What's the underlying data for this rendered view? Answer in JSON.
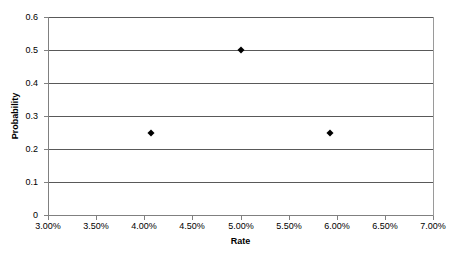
{
  "chart_data": {
    "type": "scatter",
    "title": "",
    "subtitle": "",
    "xlabel": "Rate",
    "ylabel": "Probability",
    "xlim": [
      3.0,
      7.0
    ],
    "ylim": [
      0,
      0.6
    ],
    "grid": "horizontal",
    "legend": "none",
    "x_tick_labels": [
      "3.00%",
      "3.50%",
      "4.00%",
      "4.50%",
      "5.00%",
      "5.50%",
      "6.00%",
      "6.50%",
      "7.00%"
    ],
    "x_tick_values": [
      3.0,
      3.5,
      4.0,
      4.5,
      5.0,
      5.5,
      6.0,
      6.5,
      7.0
    ],
    "y_tick_labels": [
      "0",
      "0.1",
      "0.2",
      "0.3",
      "0.4",
      "0.5",
      "0.6"
    ],
    "y_tick_values": [
      0,
      0.1,
      0.2,
      0.3,
      0.4,
      0.5,
      0.6
    ],
    "marker_shape": "diamond",
    "marker_color": "#000000",
    "points": [
      {
        "x": 4.07,
        "y": 0.25,
        "x_label": "4.07%",
        "y_label": "0.25"
      },
      {
        "x": 5.0,
        "y": 0.5,
        "x_label": "5.00%",
        "y_label": "0.5"
      },
      {
        "x": 5.93,
        "y": 0.25,
        "x_label": "5.93%",
        "y_label": "0.25"
      }
    ]
  },
  "style": {
    "plot_background": "#ffffff",
    "gridline_color": "#595959",
    "axis_color": "#808080",
    "text_color": "#000000"
  }
}
